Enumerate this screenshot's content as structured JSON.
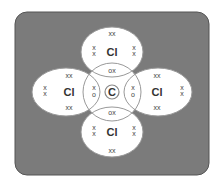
{
  "diagram": {
    "central_atom": {
      "label": "C"
    },
    "outer_atoms": [
      {
        "position": "top",
        "label": "Cl",
        "lone_pairs": [
          "xx",
          "x\nx",
          "x\nx"
        ]
      },
      {
        "position": "left",
        "label": "Cl",
        "lone_pairs": [
          "xx",
          "x\nx",
          "xx"
        ]
      },
      {
        "position": "right",
        "label": "Cl",
        "lone_pairs": [
          "xx",
          "x\nx",
          "xx"
        ]
      },
      {
        "position": "bottom",
        "label": "Cl",
        "lone_pairs": [
          "x\nx",
          "x\nx",
          "xx"
        ]
      }
    ],
    "shared_pairs": {
      "top": "ox",
      "bottom": "ox",
      "left": "x\no",
      "right": "x\no"
    },
    "colors": {
      "background": "#7a7a7a",
      "atom_fill": "#ffffff",
      "outline": "#8a8a8a"
    },
    "labels": {
      "c": "C",
      "cl_top": "Cl",
      "cl_left": "Cl",
      "cl_right": "Cl",
      "cl_bottom": "Cl",
      "ox": "ox",
      "o": "o",
      "x": "x",
      "xx": "xx"
    }
  }
}
